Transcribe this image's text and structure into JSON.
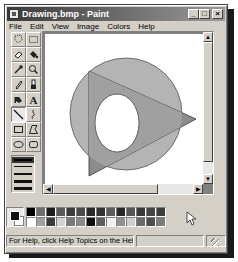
{
  "window": {
    "title": "Drawing.bmp - Paint",
    "controls": {
      "minimize": "_",
      "maximize": "□",
      "close": "×"
    }
  },
  "menubar": {
    "items": [
      {
        "label": "File"
      },
      {
        "label": "Edit"
      },
      {
        "label": "View"
      },
      {
        "label": "Image"
      },
      {
        "label": "Colors"
      },
      {
        "label": "Help"
      }
    ]
  },
  "toolbox": {
    "tools": [
      {
        "name": "free-form-select",
        "icon": "freeform-select-icon"
      },
      {
        "name": "select",
        "icon": "rect-select-icon"
      },
      {
        "name": "eraser",
        "icon": "eraser-icon"
      },
      {
        "name": "fill-with-color",
        "icon": "paint-bucket-icon"
      },
      {
        "name": "pick-color",
        "icon": "eyedropper-icon"
      },
      {
        "name": "magnifier",
        "icon": "magnifier-icon"
      },
      {
        "name": "pencil",
        "icon": "pencil-icon"
      },
      {
        "name": "brush",
        "icon": "brush-icon"
      },
      {
        "name": "airbrush",
        "icon": "airbrush-icon"
      },
      {
        "name": "text",
        "icon": "text-icon",
        "glyph": "A"
      },
      {
        "name": "line",
        "icon": "line-icon",
        "active": true
      },
      {
        "name": "curve",
        "icon": "curve-icon"
      },
      {
        "name": "rectangle",
        "icon": "rectangle-icon"
      },
      {
        "name": "polygon",
        "icon": "polygon-icon"
      },
      {
        "name": "ellipse",
        "icon": "ellipse-icon"
      },
      {
        "name": "rounded-rectangle",
        "icon": "rounded-rect-icon"
      }
    ],
    "line_widths": [
      1,
      2,
      3,
      4,
      5
    ]
  },
  "canvas": {
    "shapes": [
      {
        "type": "circle",
        "fill": "#b4b4b4",
        "stroke": "#555555"
      },
      {
        "type": "triangle",
        "fill": "#8c8c8c",
        "stroke": "#333333"
      },
      {
        "type": "ellipse",
        "fill": "#ffffff",
        "stroke": "#444444"
      }
    ]
  },
  "palette": {
    "foreground": "#111111",
    "background": "#ffffff",
    "top_row": [
      "#000000",
      "#6e6e6e",
      "#1c1c1c",
      "#5a5a5a",
      "#3c3c3c",
      "#4a4a4a",
      "#2a2a2a",
      "#323232",
      "#5c5c5c",
      "#282828",
      "#565656",
      "#3a3a3a",
      "#444444",
      "#3e3e3e"
    ],
    "bottom_row": [
      "#ffffff",
      "#a0a0a0",
      "#3a3a3a",
      "#d4d4d4",
      "#7a7a7a",
      "#8a8a8a",
      "#0e0e0e",
      "#5e5e5e",
      "#f0f0f0",
      "#909090",
      "#cfcfcf",
      "#6a6a6a",
      "#4e4e4e",
      "#7c7c7c"
    ]
  },
  "statusbar": {
    "help_text": "For Help, click Help Topics on the Help Men",
    "coords": "",
    "size": ""
  }
}
